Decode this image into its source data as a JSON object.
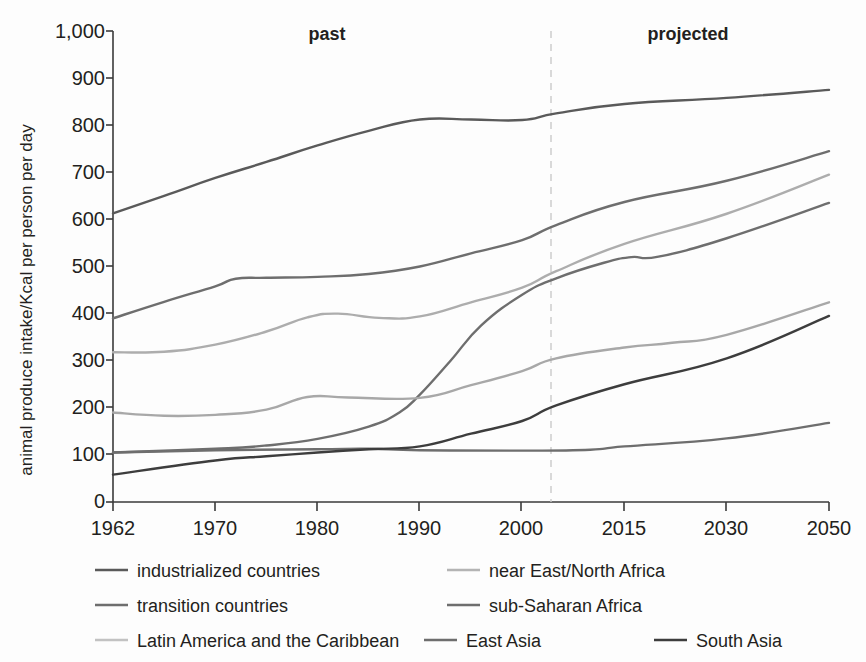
{
  "chart_data": {
    "type": "line",
    "title": "",
    "xlabel": "",
    "ylabel": "animal produce intake/Kcal per person per day",
    "ylim": [
      0,
      1000
    ],
    "ytick_values": [
      0,
      100,
      200,
      300,
      400,
      500,
      600,
      700,
      800,
      900,
      1000
    ],
    "ytick_labels": [
      "0",
      "100",
      "200",
      "300",
      "400",
      "500",
      "600",
      "700",
      "800",
      "900",
      "1,000"
    ],
    "x": [
      1962,
      1970,
      1980,
      1990,
      2000,
      2015,
      2030,
      2050
    ],
    "xtick_labels": [
      "1962",
      "1970",
      "1980",
      "1990",
      "2000",
      "2015",
      "2030",
      "2050"
    ],
    "grid": false,
    "legend_position": "bottom",
    "annotations": [
      {
        "text": "past",
        "x": 1980
      },
      {
        "text": "projected",
        "x": 2025
      }
    ],
    "divider": {
      "x": 2003,
      "style": "dashed",
      "color": "#c9c9c9"
    },
    "series": [
      {
        "name": "industrialized countries",
        "color": "#5a5a5a",
        "points": [
          [
            1962,
            613
          ],
          [
            1966,
            650
          ],
          [
            1970,
            688
          ],
          [
            1975,
            722
          ],
          [
            1980,
            757
          ],
          [
            1985,
            788
          ],
          [
            1990,
            812
          ],
          [
            1995,
            812
          ],
          [
            2000,
            811
          ],
          [
            2005,
            825
          ],
          [
            2015,
            845
          ],
          [
            2030,
            858
          ],
          [
            2050,
            875
          ]
        ]
      },
      {
        "name": "transition countries",
        "color": "#6e6e6e",
        "points": [
          [
            1962,
            390
          ],
          [
            1966,
            425
          ],
          [
            1970,
            458
          ],
          [
            1972,
            474
          ],
          [
            1975,
            476
          ],
          [
            1980,
            478
          ],
          [
            1985,
            484
          ],
          [
            1990,
            500
          ],
          [
            1995,
            528
          ],
          [
            2000,
            556
          ],
          [
            2005,
            588
          ],
          [
            2015,
            637
          ],
          [
            2030,
            682
          ],
          [
            2050,
            745
          ]
        ]
      },
      {
        "name": "Latin America and the Caribbean",
        "color": "#adadad",
        "points": [
          [
            1962,
            318
          ],
          [
            1966,
            319
          ],
          [
            1970,
            334
          ],
          [
            1975,
            362
          ],
          [
            1979,
            392
          ],
          [
            1982,
            400
          ],
          [
            1986,
            391
          ],
          [
            1990,
            394
          ],
          [
            1995,
            424
          ],
          [
            2000,
            455
          ],
          [
            2005,
            490
          ],
          [
            2015,
            548
          ],
          [
            2030,
            612
          ],
          [
            2050,
            695
          ]
        ]
      },
      {
        "name": "near East/North Africa",
        "color": "#6e6e6e",
        "points": [
          [
            1962,
            105
          ],
          [
            1970,
            113
          ],
          [
            1975,
            120
          ],
          [
            1980,
            134
          ],
          [
            1985,
            160
          ],
          [
            1988,
            190
          ],
          [
            1990,
            228
          ],
          [
            1993,
            300
          ],
          [
            1996,
            375
          ],
          [
            2000,
            440
          ],
          [
            2005,
            475
          ],
          [
            2012,
            508
          ],
          [
            2016,
            520
          ],
          [
            2020,
            521
          ],
          [
            2030,
            560
          ],
          [
            2050,
            635
          ]
        ]
      },
      {
        "name": "sub-Saharan Africa",
        "color": "#6e6e6e",
        "points": [
          [
            1962,
            105
          ],
          [
            1970,
            110
          ],
          [
            1980,
            112
          ],
          [
            1985,
            113
          ],
          [
            1990,
            110
          ],
          [
            2000,
            109
          ],
          [
            2010,
            111
          ],
          [
            2015,
            118
          ],
          [
            2030,
            135
          ],
          [
            2050,
            168
          ]
        ]
      },
      {
        "name": "East Asia",
        "color": "#a8a8a8",
        "points": [
          [
            1962,
            190
          ],
          [
            1966,
            183
          ],
          [
            1970,
            185
          ],
          [
            1975,
            196
          ],
          [
            1979,
            223
          ],
          [
            1983,
            222
          ],
          [
            1990,
            221
          ],
          [
            1995,
            248
          ],
          [
            2000,
            278
          ],
          [
            2005,
            305
          ],
          [
            2015,
            328
          ],
          [
            2022,
            338
          ],
          [
            2030,
            355
          ],
          [
            2050,
            424
          ]
        ]
      },
      {
        "name": "South Asia",
        "color": "#3d3d3d",
        "points": [
          [
            1962,
            58
          ],
          [
            1970,
            88
          ],
          [
            1975,
            97
          ],
          [
            1980,
            105
          ],
          [
            1985,
            112
          ],
          [
            1990,
            118
          ],
          [
            1995,
            145
          ],
          [
            2000,
            172
          ],
          [
            2005,
            205
          ],
          [
            2015,
            250
          ],
          [
            2030,
            305
          ],
          [
            2050,
            395
          ]
        ]
      }
    ],
    "legend": [
      {
        "label": "industrialized countries",
        "color": "#5a5a5a"
      },
      {
        "label": "near East/North Africa",
        "color": "#b4b4b4"
      },
      {
        "label": "transition countries",
        "color": "#6e6e6e"
      },
      {
        "label": "sub-Saharan Africa",
        "color": "#6e6e6e"
      },
      {
        "label": "Latin America and the Caribbean",
        "color": "#c2c2c2"
      },
      {
        "label": "East Asia",
        "color": "#6e6e6e"
      },
      {
        "label": "South Asia",
        "color": "#3d3d3d"
      }
    ]
  },
  "axes": {
    "y_title": "animal produce intake/Kcal per person per day",
    "y_ticks": [
      "1,000",
      "900",
      "800",
      "700",
      "600",
      "500",
      "400",
      "300",
      "200",
      "100",
      "0"
    ],
    "x_ticks": [
      "1962",
      "1970",
      "1980",
      "1990",
      "2000",
      "2015",
      "2030",
      "2050"
    ]
  },
  "era": {
    "past_label": "past",
    "projected_label": "projected"
  },
  "legend_entries": {
    "row1_left": "industrialized countries",
    "row1_right": "near East/North Africa",
    "row2_left": "transition countries",
    "row2_right": "sub-Saharan Africa",
    "row3_left": "Latin America and the Caribbean",
    "row3_mid": "East Asia",
    "row3_right": "South Asia"
  }
}
